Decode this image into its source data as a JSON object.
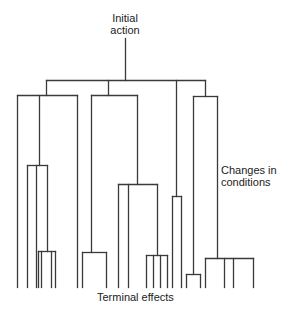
{
  "diagram": {
    "type": "tree",
    "line_color": "#3a3a3a",
    "labels": {
      "root_line1": "Initial",
      "root_line2": "action",
      "side_line1": "Changes in",
      "side_line2": "conditions",
      "bottom": "Terminal effects"
    },
    "edges": [
      [
        125,
        38,
        125,
        80
      ],
      [
        46,
        80,
        205,
        80
      ],
      [
        46,
        80,
        46,
        95
      ],
      [
        108,
        80,
        108,
        95
      ],
      [
        176,
        80,
        176,
        196
      ],
      [
        205,
        80,
        205,
        96
      ],
      [
        17,
        95,
        77,
        95
      ],
      [
        17,
        95,
        17,
        287
      ],
      [
        39,
        95,
        39,
        165
      ],
      [
        77,
        95,
        77,
        287
      ],
      [
        27,
        165,
        47,
        165
      ],
      [
        27,
        165,
        27,
        287
      ],
      [
        36,
        165,
        36,
        287
      ],
      [
        47,
        165,
        47,
        251
      ],
      [
        38,
        251,
        55,
        251
      ],
      [
        38,
        251,
        38,
        287
      ],
      [
        41,
        251,
        41,
        287
      ],
      [
        51,
        251,
        51,
        287
      ],
      [
        55,
        251,
        55,
        287
      ],
      [
        91,
        95,
        137,
        95
      ],
      [
        91,
        95,
        91,
        252
      ],
      [
        137,
        95,
        137,
        184
      ],
      [
        82,
        252,
        106,
        252
      ],
      [
        82,
        252,
        82,
        287
      ],
      [
        106,
        252,
        106,
        287
      ],
      [
        118,
        184,
        157,
        184
      ],
      [
        118,
        184,
        118,
        287
      ],
      [
        128,
        184,
        128,
        287
      ],
      [
        157,
        184,
        157,
        255
      ],
      [
        146,
        255,
        167,
        255
      ],
      [
        146,
        255,
        146,
        287
      ],
      [
        153,
        255,
        153,
        287
      ],
      [
        160,
        255,
        160,
        287
      ],
      [
        167,
        255,
        167,
        287
      ],
      [
        172,
        196,
        181,
        196
      ],
      [
        172,
        196,
        172,
        287
      ],
      [
        181,
        196,
        181,
        287
      ],
      [
        193,
        96,
        217,
        96
      ],
      [
        193,
        96,
        193,
        274
      ],
      [
        217,
        96,
        217,
        258
      ],
      [
        186,
        274,
        200,
        274
      ],
      [
        186,
        274,
        186,
        287
      ],
      [
        200,
        274,
        200,
        287
      ],
      [
        205,
        258,
        253,
        258
      ],
      [
        205,
        258,
        205,
        287
      ],
      [
        224,
        258,
        224,
        287
      ],
      [
        233,
        258,
        233,
        287
      ],
      [
        253,
        258,
        253,
        287
      ]
    ]
  }
}
